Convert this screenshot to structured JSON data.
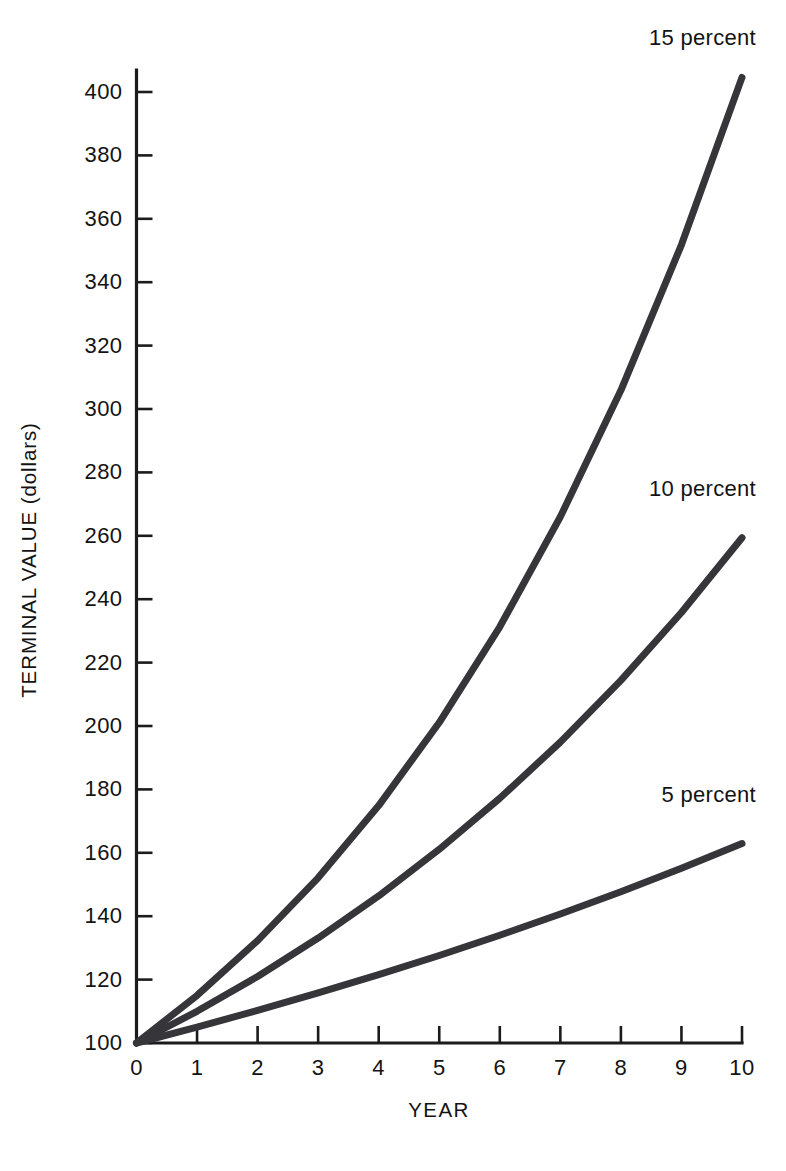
{
  "chart_data": {
    "type": "line",
    "title": "",
    "subtitle": "",
    "xlabel": "YEAR",
    "ylabel": "TERMINAL VALUE (dollars)",
    "xlim": [
      0,
      10
    ],
    "ylim": [
      100,
      405
    ],
    "grid": false,
    "legend_position": "inline-end-of-line",
    "x": [
      0,
      1,
      2,
      3,
      4,
      5,
      6,
      7,
      8,
      9,
      10
    ],
    "xticks": [
      "0",
      "1",
      "2",
      "3",
      "4",
      "5",
      "6",
      "7",
      "8",
      "9",
      "10"
    ],
    "yticks": [
      "100",
      "120",
      "140",
      "160",
      "180",
      "200",
      "220",
      "240",
      "260",
      "280",
      "300",
      "320",
      "340",
      "360",
      "380",
      "400"
    ],
    "ytick_values": [
      100,
      120,
      140,
      160,
      180,
      200,
      220,
      240,
      260,
      280,
      300,
      320,
      340,
      360,
      380,
      400
    ],
    "series": [
      {
        "name": "15 percent",
        "label": "15 percent",
        "color": "#35353a",
        "values": [
          100,
          115,
          132.3,
          152.1,
          174.9,
          201.1,
          231.3,
          266,
          305.9,
          351.8,
          404.6
        ]
      },
      {
        "name": "10 percent",
        "label": "10 percent",
        "color": "#35353a",
        "values": [
          100,
          110,
          121,
          133.1,
          146.4,
          161.1,
          177.2,
          194.9,
          214.4,
          235.8,
          259.4
        ]
      },
      {
        "name": "5 percent",
        "label": "5 percent",
        "color": "#35353a",
        "values": [
          100,
          105,
          110.3,
          115.8,
          121.6,
          127.6,
          134,
          140.7,
          147.7,
          155.1,
          162.9
        ]
      }
    ],
    "annotations": [
      {
        "text": "15 percent",
        "at_x": 10,
        "at_y": 404.6
      },
      {
        "text": "10 percent",
        "at_x": 10,
        "at_y": 259.4
      },
      {
        "text": "5 percent",
        "at_x": 10,
        "at_y": 162.9
      }
    ]
  },
  "axes": {
    "y_title": "TERMINAL VALUE (dollars)",
    "x_title": "YEAR",
    "y_tick_labels": [
      "400",
      "380",
      "360",
      "340",
      "320",
      "300",
      "280",
      "260",
      "240",
      "220",
      "200",
      "180",
      "160",
      "140",
      "120",
      "100"
    ],
    "x_tick_labels": [
      "0",
      "1",
      "2",
      "3",
      "4",
      "5",
      "6",
      "7",
      "8",
      "9",
      "10"
    ]
  },
  "annotations": {
    "line_15": "15 percent",
    "line_10": "10 percent",
    "line_5": "5 percent"
  },
  "colors": {
    "line": "#35353a",
    "axis": "#1b1b1b",
    "background": "#ffffff",
    "text": "#131313"
  }
}
